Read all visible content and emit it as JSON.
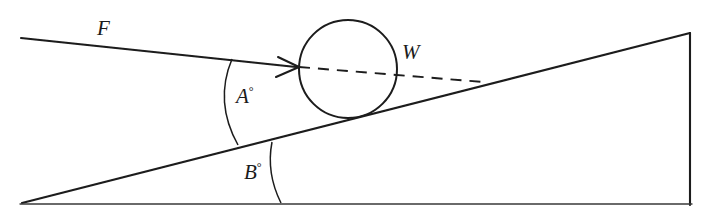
{
  "figure": {
    "kind": "inclined-plane-force-diagram",
    "width": 701,
    "height": 217,
    "background_color": "#ffffff",
    "ink_color": "#1b1b1b",
    "faint_ink_color": "#5a5a5a",
    "top_cut_text": "",
    "labels": {
      "force": "F",
      "weight": "W",
      "angle_incline_to_force": "A",
      "angle_incline_to_ground": "B",
      "degree_symbol": "°"
    },
    "geometry": {
      "ramp": {
        "name": "inclined-plane-triangle",
        "left_vertex": [
          22,
          203
        ],
        "apex": [
          690,
          33
        ],
        "right_base": [
          690,
          205
        ],
        "base_line_from": [
          22,
          204
        ],
        "base_line_to": [
          690,
          204
        ]
      },
      "ball": {
        "name": "ball-on-incline",
        "center": [
          348,
          69
        ],
        "radius": 49
      },
      "force_line": {
        "name": "applied-force-vector",
        "start": [
          21,
          38
        ],
        "arrow_tip": [
          298,
          67
        ]
      },
      "weight_line": {
        "name": "weight-dashed-line",
        "start": [
          298,
          67
        ],
        "end": [
          483,
          82
        ],
        "dash_pattern": "11 8"
      },
      "arc_a": {
        "name": "angle-a-arc",
        "from": [
          232,
          59
        ],
        "to": [
          238,
          145
        ],
        "control": [
          214,
          102
        ]
      },
      "arc_b": {
        "name": "angle-b-arc",
        "from": [
          272,
          142
        ],
        "to": [
          281,
          203
        ],
        "control": [
          266,
          173
        ]
      }
    },
    "label_positions": {
      "force": [
        97,
        18
      ],
      "weight": [
        402,
        42
      ],
      "angle_a": [
        236,
        85
      ],
      "angle_b": [
        244,
        161
      ]
    }
  }
}
